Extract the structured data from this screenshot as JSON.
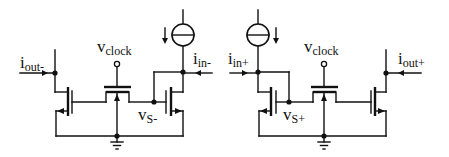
{
  "diagram": {
    "type": "circuit-schematic",
    "colors": {
      "line": "#111111",
      "background": "#ffffff"
    },
    "left_half": {
      "output_label": {
        "main": "i",
        "sub": "out-"
      },
      "input_label": {
        "main": "i",
        "sub": "in-"
      },
      "clock_label": {
        "main": "v",
        "sub": "clock"
      },
      "node_label": {
        "main": "v",
        "sub": "S-"
      }
    },
    "right_half": {
      "output_label": {
        "main": "i",
        "sub": "out+"
      },
      "input_label": {
        "main": "i",
        "sub": "in+"
      },
      "clock_label": {
        "main": "v",
        "sub": "clock"
      },
      "node_label": {
        "main": "v",
        "sub": "S+"
      }
    },
    "components": [
      "current-source-left",
      "current-source-right",
      "nmos-output-left",
      "nmos-input-left",
      "nmos-switch-left",
      "nmos-output-right",
      "nmos-input-right",
      "nmos-switch-right",
      "ground-left",
      "ground-right"
    ]
  }
}
